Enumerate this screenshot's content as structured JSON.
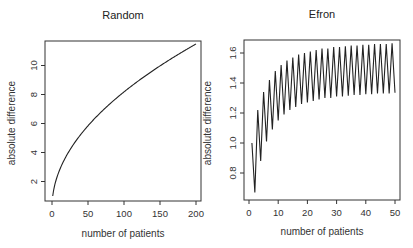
{
  "chart_data": [
    {
      "type": "line",
      "title": "Random",
      "xlabel": "number of patients",
      "ylabel": "absolute difference",
      "xlim": [
        0,
        200
      ],
      "ylim": [
        0.5,
        11.8
      ],
      "xticks": [
        0,
        50,
        100,
        150,
        200
      ],
      "yticks": [
        2,
        4,
        6,
        8,
        10
      ],
      "xtick_labels": [
        "0",
        "50",
        "100",
        "150",
        "200"
      ],
      "ytick_labels": [
        "2",
        "4",
        "6",
        "8",
        "10"
      ],
      "grid": false,
      "series": [
        {
          "name": "Random",
          "formula": "sqrt(2n/pi)",
          "x": [
            1,
            5,
            10,
            20,
            30,
            40,
            50,
            75,
            100,
            125,
            150,
            175,
            200
          ],
          "values": [
            0.8,
            1.78,
            2.52,
            3.57,
            4.37,
            5.05,
            5.64,
            6.91,
            7.98,
            8.92,
            9.77,
            10.56,
            11.28
          ]
        }
      ]
    },
    {
      "type": "line",
      "title": "Efron",
      "xlabel": "number of patients",
      "ylabel": "absolute difference",
      "xlim": [
        0,
        50
      ],
      "ylim": [
        0.62,
        1.7
      ],
      "xticks": [
        0,
        10,
        20,
        30,
        40,
        50
      ],
      "yticks": [
        0.8,
        1.0,
        1.2,
        1.4,
        1.6
      ],
      "xtick_labels": [
        "0",
        "10",
        "20",
        "30",
        "40",
        "50"
      ],
      "ytick_labels": [
        "0.8",
        "1.0",
        "1.2",
        "1.4",
        "1.6"
      ],
      "grid": false,
      "series": [
        {
          "name": "Efron",
          "x": [
            1,
            2,
            3,
            4,
            5,
            6,
            7,
            8,
            9,
            10,
            11,
            12,
            13,
            14,
            15,
            16,
            17,
            18,
            19,
            20,
            21,
            22,
            23,
            24,
            25,
            26,
            27,
            28,
            29,
            30,
            31,
            32,
            33,
            34,
            35,
            36,
            37,
            38,
            39,
            40,
            41,
            42,
            43,
            44,
            45,
            46,
            47,
            48,
            49,
            50
          ],
          "values": [
            1.0,
            0.67,
            1.22,
            0.88,
            1.34,
            1.01,
            1.42,
            1.09,
            1.48,
            1.15,
            1.52,
            1.19,
            1.55,
            1.22,
            1.57,
            1.24,
            1.59,
            1.26,
            1.6,
            1.27,
            1.61,
            1.28,
            1.62,
            1.29,
            1.63,
            1.3,
            1.63,
            1.3,
            1.64,
            1.31,
            1.64,
            1.31,
            1.645,
            1.315,
            1.65,
            1.32,
            1.65,
            1.32,
            1.655,
            1.325,
            1.655,
            1.325,
            1.66,
            1.33,
            1.66,
            1.33,
            1.66,
            1.33,
            1.665,
            1.335
          ]
        }
      ]
    }
  ],
  "plots": {
    "left": {
      "title": "Random",
      "xlabel": "number of patients",
      "ylabel": "absolute difference"
    },
    "right": {
      "title": "Efron",
      "xlabel": "number of patients",
      "ylabel": "absolute difference"
    }
  }
}
